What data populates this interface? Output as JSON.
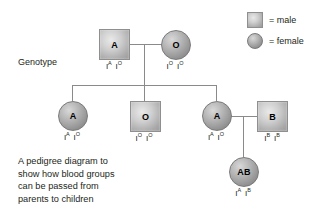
{
  "diagram": {
    "genotype_label": "Genotype",
    "caption_lines": [
      "A pedigree diagram to",
      "show how blood groups",
      "can be passed from",
      "parents to children"
    ],
    "colors": {
      "line": "#8a8a8a",
      "text": "#231f20",
      "male_fill": "#cfcfcf",
      "female_fill": "#b6b6b6",
      "background": "#ffffff"
    }
  },
  "legend": {
    "items": [
      {
        "key_icon": "male-square-icon",
        "shape": "square",
        "label": "= male"
      },
      {
        "key_icon": "female-circle-icon",
        "shape": "circle",
        "label": "= female"
      }
    ]
  },
  "people": [
    {
      "id": "p1-father",
      "generation": 1,
      "sex": "male",
      "shape": "square",
      "blood_group": "A",
      "genotype": {
        "allele1": {
          "base": "I",
          "sup": "A"
        },
        "allele2": {
          "base": "I",
          "sup": "O"
        }
      }
    },
    {
      "id": "p1-mother",
      "generation": 1,
      "sex": "female",
      "shape": "circle",
      "blood_group": "O",
      "genotype": {
        "allele1": {
          "base": "I",
          "sup": "O"
        },
        "allele2": {
          "base": "I",
          "sup": "O"
        }
      }
    },
    {
      "id": "p2-child1",
      "generation": 2,
      "sex": "female",
      "shape": "circle",
      "blood_group": "A",
      "genotype": {
        "allele1": {
          "base": "I",
          "sup": "A"
        },
        "allele2": {
          "base": "I",
          "sup": "O"
        }
      }
    },
    {
      "id": "p2-child2",
      "generation": 2,
      "sex": "male",
      "shape": "square",
      "blood_group": "O",
      "genotype": {
        "allele1": {
          "base": "I",
          "sup": "O"
        },
        "allele2": {
          "base": "I",
          "sup": "O"
        }
      }
    },
    {
      "id": "p2-child3",
      "generation": 2,
      "sex": "female",
      "shape": "circle",
      "blood_group": "A",
      "genotype": {
        "allele1": {
          "base": "I",
          "sup": "A"
        },
        "allele2": {
          "base": "I",
          "sup": "O"
        }
      }
    },
    {
      "id": "p2-spouse",
      "generation": 2,
      "sex": "male",
      "shape": "square",
      "blood_group": "B",
      "genotype": {
        "allele1": {
          "base": "I",
          "sup": "B"
        },
        "allele2": {
          "base": "I",
          "sup": "B"
        }
      }
    },
    {
      "id": "p3-child",
      "generation": 3,
      "sex": "female",
      "shape": "circle",
      "blood_group": "AB",
      "genotype": {
        "allele1": {
          "base": "I",
          "sup": "A"
        },
        "allele2": {
          "base": "I",
          "sup": "B"
        }
      }
    }
  ]
}
